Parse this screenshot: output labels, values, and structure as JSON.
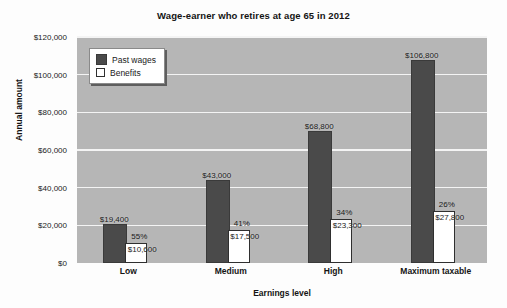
{
  "chart_data": {
    "type": "bar",
    "title": "Wage-earner who retires at age 65 in 2012",
    "xlabel": "Earnings level",
    "ylabel": "Annual amount",
    "categories": [
      "Low",
      "Medium",
      "High",
      "Maximum taxable"
    ],
    "ylim": [
      0,
      120000
    ],
    "yticks": [
      0,
      20000,
      40000,
      60000,
      80000,
      100000,
      120000
    ],
    "ytick_labels": [
      "$0",
      "$20,000",
      "$40,000",
      "$60,000",
      "$80,000",
      "$100,000",
      "$120,000"
    ],
    "grid": true,
    "legend_position": "top-left-inside",
    "series": [
      {
        "name": "Past wages",
        "color": "#4a4a4a",
        "values": [
          19400,
          43000,
          68800,
          106800
        ],
        "data_labels": [
          "$19,400",
          "$43,000",
          "$68,800",
          "$106,800"
        ]
      },
      {
        "name": "Benefits",
        "color": "#ffffff",
        "values": [
          10600,
          17500,
          23300,
          27800
        ],
        "data_labels": [
          "$10,600",
          "$17,500",
          "$23,300",
          "$27,800"
        ],
        "pct_labels": [
          "55%",
          "41%",
          "34%",
          "26%"
        ],
        "pct_values": [
          55,
          41,
          34,
          26
        ]
      }
    ],
    "annotations": [
      "55% of $19,400",
      "41% of $43,000",
      "34% of $68,800",
      "26% of $106,800"
    ],
    "plot_background": "#b6b6b6",
    "gridline_color": "#f4f4f4"
  }
}
